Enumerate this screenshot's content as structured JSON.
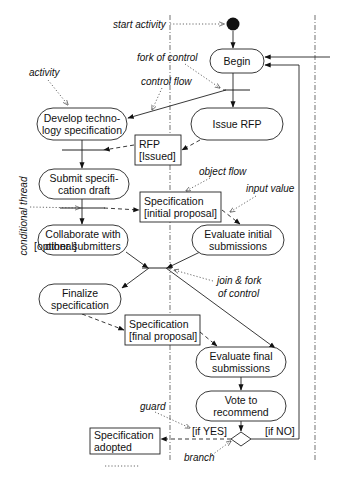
{
  "diagram": {
    "type": "uml-activity-diagram",
    "activities": [
      {
        "id": "begin",
        "lines": [
          "Begin"
        ],
        "x": 210,
        "y": 49,
        "w": 54,
        "h": 24
      },
      {
        "id": "develop",
        "lines": [
          "Develop techno-",
          "logy specification"
        ],
        "x": 37,
        "y": 108,
        "w": 90,
        "h": 32
      },
      {
        "id": "issue-rfp",
        "lines": [
          "Issue RFP"
        ],
        "x": 191,
        "y": 108,
        "w": 92,
        "h": 32
      },
      {
        "id": "submit",
        "lines": [
          "Submit specifi-",
          "cation draft"
        ],
        "x": 39,
        "y": 169,
        "w": 90,
        "h": 30
      },
      {
        "id": "collaborate",
        "lines": [
          "Collaborate with",
          "other submitters"
        ],
        "x": 38,
        "y": 225,
        "w": 90,
        "h": 30
      },
      {
        "id": "evaluate-initial",
        "lines": [
          "Evaluate initial",
          "submissions"
        ],
        "x": 192,
        "y": 225,
        "w": 92,
        "h": 30
      },
      {
        "id": "finalize",
        "lines": [
          "Finalize",
          "specification"
        ],
        "x": 39,
        "y": 284,
        "w": 82,
        "h": 30
      },
      {
        "id": "evaluate-final",
        "lines": [
          "Evaluate final",
          "submissions"
        ],
        "x": 196,
        "y": 347,
        "w": 90,
        "h": 30
      },
      {
        "id": "vote",
        "lines": [
          "Vote to",
          "recommend"
        ],
        "x": 196,
        "y": 391,
        "w": 90,
        "h": 30
      }
    ],
    "objects": [
      {
        "id": "rfp-issued",
        "lines": [
          "RFP",
          "[Issued]"
        ],
        "x": 135,
        "y": 135,
        "w": 46,
        "h": 30
      },
      {
        "id": "spec-initial",
        "lines": [
          "Specification",
          "[initial proposal]"
        ],
        "x": 140,
        "y": 192,
        "w": 81,
        "h": 30
      },
      {
        "id": "spec-final",
        "lines": [
          "Specification",
          "[final proposal]"
        ],
        "x": 125,
        "y": 315,
        "w": 75,
        "h": 30
      },
      {
        "id": "spec-adopted",
        "lines": [
          "Specification",
          "adopted"
        ],
        "x": 90,
        "y": 428,
        "w": 70,
        "h": 26
      }
    ],
    "guards": [
      {
        "id": "guard-optional",
        "text": "[optional]",
        "x": 34,
        "y": 250
      },
      {
        "id": "guard-yes",
        "text": "[if YES]",
        "x": 192,
        "y": 435
      },
      {
        "id": "guard-no",
        "text": "[if NO]",
        "x": 265,
        "y": 435
      }
    ],
    "annotations": [
      {
        "id": "start-activity",
        "text": "start activity",
        "x": 113,
        "y": 28
      },
      {
        "id": "fork-of-control",
        "text": "fork of control",
        "x": 137,
        "y": 61
      },
      {
        "id": "activity",
        "text": "activity",
        "x": 29,
        "y": 76
      },
      {
        "id": "control-flow",
        "text": "control flow",
        "x": 141,
        "y": 85
      },
      {
        "id": "object-flow",
        "text": "object flow",
        "x": 199,
        "y": 175
      },
      {
        "id": "input-value",
        "text": "input value",
        "x": 246,
        "y": 192
      },
      {
        "id": "join-fork",
        "text": "join & fork",
        "x": 217,
        "y": 284
      },
      {
        "id": "of-control",
        "text": "of control",
        "x": 218,
        "y": 297
      },
      {
        "id": "guard",
        "text": "guard",
        "x": 140,
        "y": 410
      },
      {
        "id": "branch",
        "text": "branch",
        "x": 184,
        "y": 461
      }
    ],
    "vertical_label": {
      "text": "conditional thread",
      "x": 27,
      "y": 216
    },
    "legend_dots": {
      "x": 105,
      "y": 466,
      "w": 35
    }
  }
}
